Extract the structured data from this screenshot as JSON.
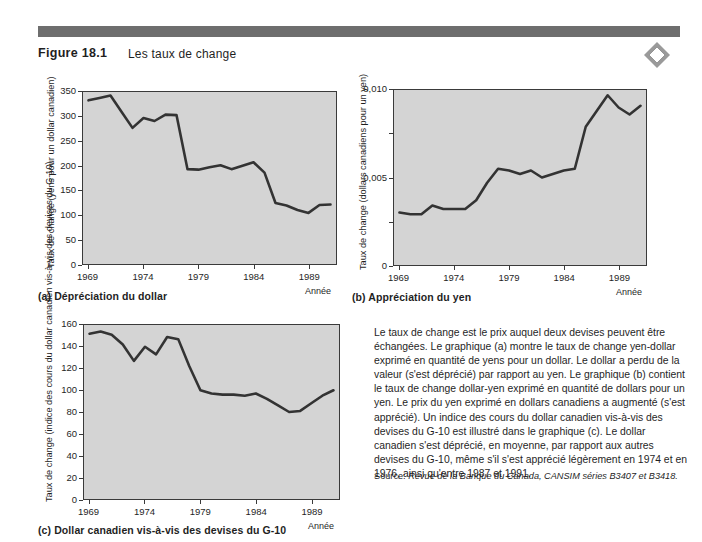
{
  "header": {
    "figure_label": "Figure 18.1",
    "figure_title": "Les taux de change",
    "bar_color": "#6e6e6e",
    "logo_icon": "diamond-logo-icon"
  },
  "common": {
    "xaxis_name": "Année",
    "plot_bg": "#d4d4d4",
    "line_color": "#333333"
  },
  "body": {
    "paragraph": "Le taux de change est le prix auquel deux devises peuvent être échangées. Le graphique (a) montre le taux de change yen-dollar exprimé en quantité de yens pour un dollar. Le dollar a perdu de la valeur (s'est déprécié) par rapport au yen. Le graphique (b) contient le taux de change dollar-yen exprimé en quantité de dollars pour un yen. Le prix du yen exprimé en dollars canadiens a augmenté (s'est apprécié). Un indice des cours du dollar canadien vis-à-vis des devises du G-10 est illustré dans le graphique (c). Le dollar canadien s'est déprécié, en moyenne, par rapport aux autres devises du G-10, même s'il s'est apprécié légèrement en 1974 et en 1976, ainsi qu'entre 1987 et 1991.",
    "source_lead": "Source:",
    "source_body": " Revue de la Banque du Canada, CANSIM séries B3407 et B3418."
  },
  "chart_data": [
    {
      "id": "a",
      "type": "line",
      "title": "(a) Dépréciation du dollar",
      "xlabel": "Année",
      "ylabel": "Taux de change (yens pour un dollar canadien)",
      "xlim": [
        1968.5,
        1991.5
      ],
      "ylim": [
        0,
        350
      ],
      "yticks": [
        0,
        50,
        100,
        150,
        200,
        250,
        300,
        350
      ],
      "ytick_labels": [
        "0",
        "50",
        "100",
        "150",
        "200",
        "250",
        "300",
        "350"
      ],
      "xticks": [
        1969,
        1974,
        1979,
        1984,
        1989
      ],
      "xtick_labels": [
        "1969",
        "1974",
        "1979",
        "1984",
        "1989"
      ],
      "grid": false,
      "legend": "none",
      "x": [
        1969,
        1970,
        1971,
        1972,
        1973,
        1974,
        1975,
        1976,
        1977,
        1978,
        1979,
        1980,
        1981,
        1982,
        1983,
        1984,
        1985,
        1986,
        1987,
        1988,
        1989,
        1990,
        1991
      ],
      "values": [
        333,
        338,
        343,
        310,
        277,
        297,
        291,
        304,
        303,
        193,
        192,
        197,
        201,
        193,
        200,
        207,
        186,
        124,
        119,
        110,
        104,
        120,
        121
      ]
    },
    {
      "id": "b",
      "type": "line",
      "title": "(b) Appréciation du yen",
      "xlabel": "Année",
      "ylabel": "Taux de change (dollars canadiens pour un yen)",
      "xlim": [
        1968.5,
        1991.5
      ],
      "ylim": [
        0,
        0.01
      ],
      "yticks": [
        0,
        0.0025,
        0.005,
        0.0075,
        0.01
      ],
      "ytick_labels": [
        "0",
        "",
        "0,005",
        "",
        "0,010"
      ],
      "xticks": [
        1969,
        1974,
        1979,
        1984,
        1989
      ],
      "xtick_labels": [
        "1969",
        "1974",
        "1979",
        "1984",
        "1989"
      ],
      "grid": false,
      "legend": "none",
      "x": [
        1969,
        1970,
        1971,
        1972,
        1973,
        1974,
        1975,
        1976,
        1977,
        1978,
        1979,
        1980,
        1981,
        1982,
        1983,
        1984,
        1985,
        1986,
        1987,
        1988,
        1989,
        1990,
        1991
      ],
      "values": [
        0.003,
        0.0029,
        0.0029,
        0.0034,
        0.0032,
        0.0032,
        0.0032,
        0.0037,
        0.0047,
        0.0055,
        0.0054,
        0.0052,
        0.0054,
        0.005,
        0.0052,
        0.0054,
        0.0055,
        0.0079,
        0.0088,
        0.0097,
        0.009,
        0.0086,
        0.0091
      ]
    },
    {
      "id": "c",
      "type": "line",
      "title": "(c) Dollar canadien vis-à-vis des devises du G-10",
      "xlabel": "Année",
      "ylabel": "Taux de change (indice des cours du dollar canadien vis-à-vis des devises du G-10)",
      "xlim": [
        1968.5,
        1991.5
      ],
      "ylim": [
        0,
        160
      ],
      "yticks": [
        0,
        20,
        40,
        60,
        80,
        100,
        120,
        140,
        160
      ],
      "ytick_labels": [
        "0",
        "20",
        "40",
        "60",
        "80",
        "100",
        "120",
        "140",
        "160"
      ],
      "xticks": [
        1969,
        1974,
        1979,
        1984,
        1989
      ],
      "xtick_labels": [
        "1969",
        "1974",
        "1979",
        "1984",
        "1989"
      ],
      "grid": false,
      "legend": "none",
      "x": [
        1969,
        1970,
        1971,
        1972,
        1973,
        1974,
        1975,
        1976,
        1977,
        1978,
        1979,
        1980,
        1981,
        1982,
        1983,
        1984,
        1985,
        1986,
        1987,
        1988,
        1989,
        1990,
        1991
      ],
      "values": [
        152,
        154,
        151,
        142,
        127,
        140,
        133,
        149,
        147,
        122,
        100,
        97,
        96,
        96,
        95,
        97,
        92,
        86,
        80,
        81,
        88,
        95,
        100
      ]
    }
  ]
}
